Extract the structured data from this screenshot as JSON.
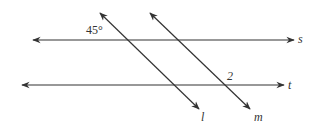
{
  "diagram": {
    "type": "parallel-lines-with-transversals",
    "color": "#333333",
    "lines": [
      {
        "name": "s",
        "label": "s",
        "x1": 33,
        "y1": 40,
        "x2": 294,
        "y2": 40
      },
      {
        "name": "t",
        "label": "t",
        "x1": 22,
        "y1": 85,
        "x2": 284,
        "y2": 85
      },
      {
        "name": "l",
        "label": "l",
        "x1": 100,
        "y1": 13,
        "x2": 199,
        "y2": 109
      },
      {
        "name": "m",
        "label": "m",
        "x1": 150,
        "y1": 13,
        "x2": 250,
        "y2": 109
      }
    ],
    "angle_labels": {
      "angle_45": "45°",
      "angle_2": "2"
    }
  }
}
